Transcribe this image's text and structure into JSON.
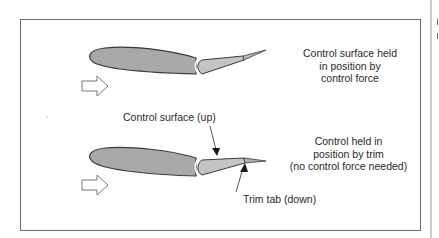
{
  "diagram": {
    "labels": {
      "top_right": [
        "Control surface held",
        "in position by",
        "control force"
      ],
      "control_surface_up": "Control surface (up)",
      "bottom_right": [
        "Control held in",
        "position by trim",
        "(no control force needed)"
      ],
      "trim_tab_down": "Trim tab (down)"
    },
    "colors": {
      "airfoil_fill": "#a9a9a9",
      "control_surface_fill": "#c4c4c4",
      "trim_tab_fill": "#b0b0b0",
      "outline": "#3a3a3a",
      "frame": "#6a6a6a",
      "text": "#2a2a2a"
    },
    "icons": {
      "airflow_arrow_top": "hollow-right-arrow",
      "airflow_arrow_bottom": "hollow-right-arrow"
    }
  }
}
